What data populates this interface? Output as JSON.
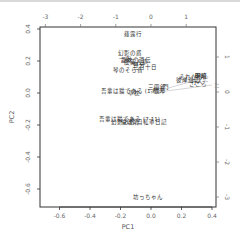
{
  "chart_data": {
    "type": "scatter",
    "subtype": "biplot",
    "title": "",
    "xlabel": "PC1",
    "ylabel": "PC2",
    "xlim": [
      -0.72,
      0.42
    ],
    "ylim": [
      -0.72,
      0.41
    ],
    "grid": false,
    "legend": "none",
    "bottom_ticks": [
      "-0.6",
      "-0.4",
      "-0.2",
      "0.0",
      "0.2",
      "0.4"
    ],
    "left_ticks": [
      "0.4",
      "0.2",
      "0.0",
      "-0.2",
      "-0.4",
      "-0.6"
    ],
    "top_ticks": [
      "-3",
      "-2",
      "-1",
      "0",
      "1"
    ],
    "right_ticks": [
      "1",
      "0",
      "-1",
      "-2",
      "-3"
    ],
    "points": [
      {
        "label": "薤露行",
        "x": -0.12,
        "y": 0.37
      },
      {
        "label": "幻影の盾",
        "x": -0.14,
        "y": 0.25
      },
      {
        "label": "一夜",
        "x": -0.17,
        "y": 0.215
      },
      {
        "label": "趣味の遺伝",
        "x": -0.1,
        "y": 0.205
      },
      {
        "label": "虞美人草",
        "x": -0.1,
        "y": 0.195
      },
      {
        "label": "野分",
        "x": -0.08,
        "y": 0.175
      },
      {
        "label": "二百十日",
        "x": -0.04,
        "y": 0.165
      },
      {
        "label": "琴のそら音",
        "x": -0.15,
        "y": 0.145
      },
      {
        "label": "それから",
        "x": 0.26,
        "y": 0.1
      },
      {
        "label": "明暗",
        "x": 0.33,
        "y": 0.105
      },
      {
        "label": "彼岸過迄",
        "x": 0.24,
        "y": 0.08
      },
      {
        "label": "行人",
        "x": 0.3,
        "y": 0.07
      },
      {
        "label": "こころ",
        "x": 0.31,
        "y": 0.055
      },
      {
        "label": "三四郎",
        "x": 0.04,
        "y": 0.035
      },
      {
        "label": "門",
        "x": 0.1,
        "y": 0.04
      },
      {
        "label": "坑夫",
        "x": 0.05,
        "y": 0.02
      },
      {
        "label": "道草",
        "x": 0.06,
        "y": 0.01
      },
      {
        "label": "吾輩は猫である (1-6)",
        "x": -0.14,
        "y": 0.015
      },
      {
        "label": "草枕",
        "x": -0.11,
        "y": 0.0
      },
      {
        "label": "吾輩は猫である (7-11)",
        "x": -0.14,
        "y": -0.165
      },
      {
        "label": "倫敦塔",
        "x": -0.14,
        "y": -0.18
      },
      {
        "label": "幻影の盾/自転車日記",
        "x": -0.08,
        "y": -0.18
      },
      {
        "label": "坊っちゃん",
        "x": -0.02,
        "y": -0.65
      }
    ],
    "vectors": [
      {
        "label": "た",
        "x": 0.4,
        "y": 0.05
      },
      {
        "label": "だ",
        "x": 0.33,
        "y": 0.09
      }
    ]
  }
}
